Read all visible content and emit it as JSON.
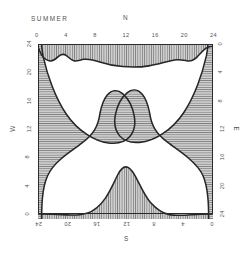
{
  "figure": {
    "season_label": "SUMMER",
    "compass": {
      "north": "N",
      "south": "S",
      "west": "W",
      "east": "E"
    }
  },
  "axes": {
    "top": {
      "ticks": [
        "0",
        "4",
        "8",
        "12",
        "16",
        "20",
        "24"
      ]
    },
    "bottom": {
      "ticks": [
        "24",
        "20",
        "16",
        "12",
        "8",
        "4",
        "0"
      ]
    },
    "left": {
      "ticks": [
        "24",
        "20",
        "16",
        "12",
        "8",
        "4",
        "0"
      ]
    },
    "right": {
      "ticks": [
        "0",
        "4",
        "8",
        "12",
        "16",
        "20",
        "24"
      ]
    }
  },
  "colors": {
    "outline": "#2b2b2b",
    "hatch": "#8c8c8c",
    "hatch_background": "#cfcfcf",
    "open_region": "#ffffff",
    "text": "#555052"
  },
  "chart_data": {
    "type": "area",
    "title": "SUMMER",
    "xlabel": "",
    "ylabel": "",
    "grid": false,
    "legend": null,
    "axis_ranges": {
      "top": [
        0,
        24
      ],
      "bottom": [
        24,
        0
      ],
      "left": [
        24,
        0
      ],
      "right": [
        0,
        24
      ]
    },
    "tick_interval": 4,
    "series": [
      {
        "name": "north-edge-shaded-boundary",
        "orientation": "top",
        "hatch": "vertical",
        "x": [
          0,
          2,
          3.2,
          4.4,
          5.5,
          6.5,
          8,
          10,
          11.5,
          13,
          15,
          17,
          18.6,
          19.6,
          20.6,
          21.6,
          22.6,
          24
        ],
        "depth_from_edge": [
          0.0,
          0.3,
          1.2,
          2.0,
          2.1,
          1.9,
          2.3,
          2.8,
          3.0,
          3.1,
          3.2,
          3.2,
          3.0,
          2.3,
          1.5,
          0.8,
          0.3,
          0.0
        ]
      },
      {
        "name": "south-edge-shaded-boundary",
        "orientation": "bottom",
        "hatch": "vertical",
        "x": [
          0,
          2,
          4,
          6,
          7.5,
          9,
          10.5,
          12,
          13.2,
          14.5,
          16,
          17.5,
          19,
          21,
          24
        ],
        "depth_from_edge": [
          0.3,
          0.5,
          0.8,
          1.6,
          2.8,
          4.6,
          6.6,
          7.8,
          7.2,
          5.6,
          3.6,
          2.0,
          1.0,
          0.5,
          0.3
        ]
      },
      {
        "name": "west-edge-shaded-boundary",
        "orientation": "left",
        "hatch": "horizontal",
        "y": [
          0,
          2,
          3.2,
          4.2,
          5.6,
          7.0,
          8.2,
          9.2,
          10.4,
          11.6,
          13.0,
          15.0,
          18.0,
          21.0,
          24.0
        ],
        "depth_from_edge": [
          0.6,
          0.8,
          3.0,
          5.0,
          7.6,
          9.2,
          8.6,
          6.8,
          5.0,
          3.6,
          3.0,
          2.6,
          2.0,
          1.2,
          0.5
        ]
      },
      {
        "name": "east-edge-shaded-boundary",
        "orientation": "right",
        "hatch": "horizontal",
        "y": [
          0,
          2,
          3.4,
          4.4,
          5.8,
          7.2,
          8.4,
          9.6,
          10.8,
          12.2,
          14.0,
          16.5,
          19.5,
          22.0,
          24.0
        ],
        "depth_from_edge": [
          0.5,
          1.0,
          3.4,
          5.4,
          7.8,
          9.0,
          8.2,
          6.4,
          4.8,
          3.6,
          3.0,
          2.6,
          2.2,
          1.4,
          0.6
        ]
      }
    ]
  }
}
